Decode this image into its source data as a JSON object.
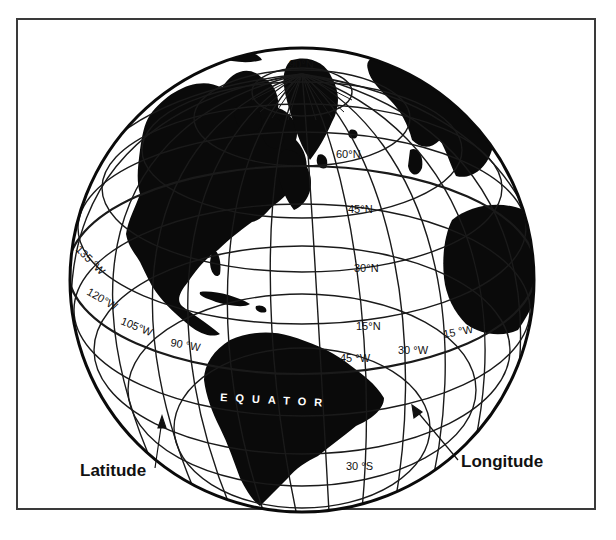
{
  "figure": {
    "type": "globe-diagram",
    "colors": {
      "land": "#0a0a0a",
      "ocean": "#ffffff",
      "grid": "#1a1a1a",
      "frame": "#3a3a3a"
    },
    "pole_label": "90°N",
    "latitude_labels": [
      "60°N",
      "45°N",
      "30°N",
      "15°N",
      "30 °S"
    ],
    "longitude_labels": [
      "135 °W",
      "120°W",
      "105°W",
      "90 °W",
      "45 °W",
      "30 °W",
      "15 °W"
    ],
    "equator_label": "EQUATOR",
    "callouts": {
      "latitude": "Latitude",
      "longitude": "Longitude"
    }
  }
}
